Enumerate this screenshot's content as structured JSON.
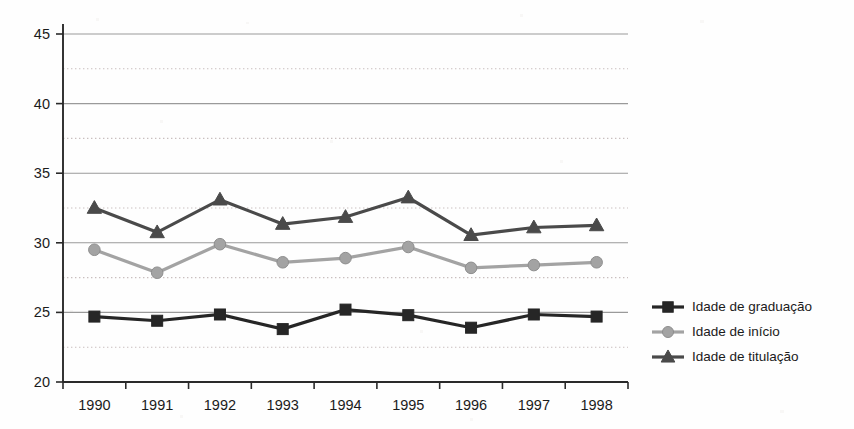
{
  "chart_data": {
    "type": "line",
    "title": "",
    "subtitle": "",
    "xlabel": "",
    "ylabel": "",
    "categories": [
      "1990",
      "1991",
      "1992",
      "1993",
      "1994",
      "1995",
      "1996",
      "1997",
      "1998"
    ],
    "ylim": [
      20,
      45
    ],
    "yticks": [
      20,
      25,
      30,
      35,
      40,
      45
    ],
    "ytick_labels": [
      "20",
      "25",
      "30",
      "35",
      "40",
      "45"
    ],
    "minor_gridlines": [
      22.5,
      27.5,
      32.5,
      37.5,
      42.5
    ],
    "grid": "horizontal-solid-major-dotted-minor",
    "legend_position": "right",
    "series": [
      {
        "name": "Idade de graduação",
        "marker": "square",
        "color": "#262626",
        "values": [
          24.7,
          24.4,
          24.85,
          23.8,
          25.2,
          24.8,
          23.9,
          24.85,
          24.7
        ]
      },
      {
        "name": "Idade de início",
        "marker": "circle",
        "color": "#a3a3a3",
        "values": [
          29.5,
          27.85,
          29.9,
          28.6,
          28.9,
          29.7,
          28.2,
          28.4,
          28.6
        ]
      },
      {
        "name": "Idade de titulação",
        "marker": "triangle",
        "color": "#4a4a4a",
        "values": [
          32.5,
          30.75,
          33.1,
          31.35,
          31.85,
          33.25,
          30.55,
          31.1,
          31.25
        ]
      }
    ]
  },
  "legend": {
    "items": [
      {
        "label": "Idade de graduação",
        "marker": "square-marker",
        "color": "#262626"
      },
      {
        "label": "Idade de início",
        "marker": "circle-marker",
        "color": "#a3a3a3"
      },
      {
        "label": "Idade de titulação",
        "marker": "triangle-marker",
        "color": "#4a4a4a"
      }
    ]
  },
  "colors": {
    "graduacao": "#262626",
    "inicio": "#a3a3a3",
    "titulacao": "#4a4a4a",
    "axis": "#2a2a2a",
    "grid_major": "#9a9a9a",
    "grid_minor": "#c9bfbf",
    "background": "#fefefe"
  }
}
